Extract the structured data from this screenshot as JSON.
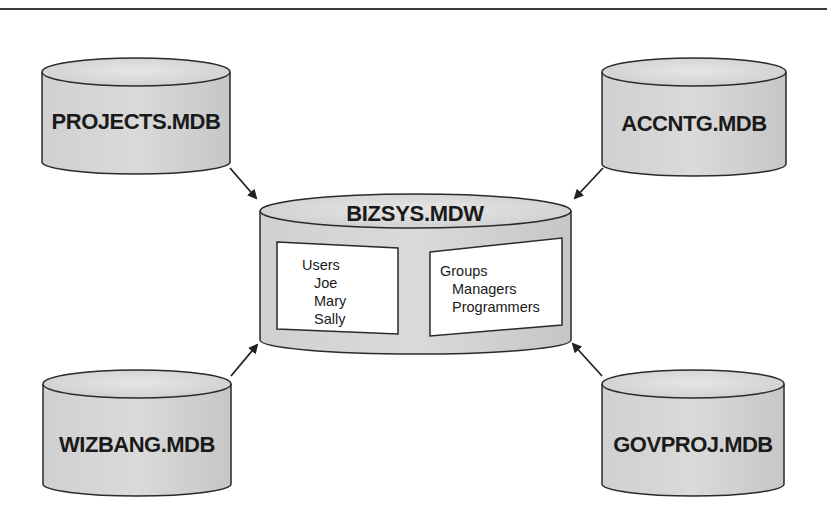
{
  "diagram": {
    "central": {
      "label": "BIZSYS.MDW",
      "users_box": {
        "heading": "Users",
        "items": [
          "Joe",
          "Mary",
          "Sally"
        ]
      },
      "groups_box": {
        "heading": "Groups",
        "items": [
          "Managers",
          "Programmers"
        ]
      }
    },
    "databases": [
      {
        "label": "PROJECTS.MDB",
        "position": "top-left"
      },
      {
        "label": "ACCNTG.MDB",
        "position": "top-right"
      },
      {
        "label": "WIZBANG.MDB",
        "position": "bottom-left"
      },
      {
        "label": "GOVPROJ.MDB",
        "position": "bottom-right"
      }
    ],
    "colors": {
      "cylinder_fill": "#d6d6d6",
      "cylinder_top": "#e2e2e2",
      "stroke": "#2a2a2a",
      "box_fill": "#ffffff",
      "rule": "#3a3a3a"
    }
  }
}
